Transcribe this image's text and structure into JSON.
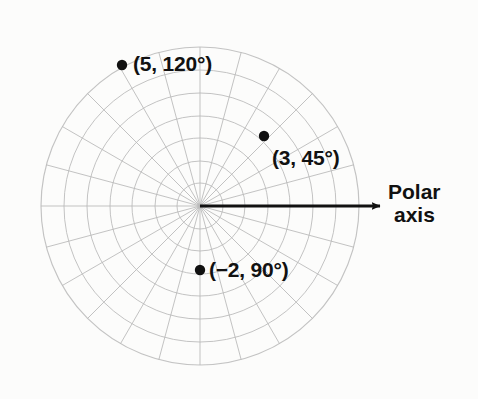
{
  "figure": {
    "background_color": "#fcfcfb",
    "grid_color": "#b9b9b9",
    "ink_color": "#111111"
  },
  "axis": {
    "name": "polar-axis",
    "label_line1": "Polar",
    "label_line2": "axis",
    "arrow_from": [
      200,
      206
    ],
    "arrow_to": [
      380,
      206
    ]
  },
  "chart_data": {
    "type": "scatter",
    "coordinate_system": "polar",
    "title": "",
    "xlabel": "",
    "ylabel": "",
    "center": [
      200,
      206
    ],
    "outer_radius": 159,
    "rings": 7,
    "ring_radii": [
      23,
      45,
      68,
      90,
      113,
      136,
      159
    ],
    "radial_lines": 24,
    "radial_step_degrees": 15,
    "grid": true,
    "legend": "none",
    "points": [
      {
        "label": "(5, 120°)",
        "r": 5,
        "theta_degrees": 120,
        "px": [
          122,
          65
        ],
        "label_px": [
          133,
          52
        ]
      },
      {
        "label": "(3, 45°)",
        "r": 3,
        "theta_degrees": 45,
        "px": [
          264,
          136
        ],
        "label_px": [
          272,
          146
        ]
      },
      {
        "label": "(−2, 90°)",
        "r": -2,
        "theta_degrees": 90,
        "px": [
          200,
          270
        ],
        "label_px": [
          209,
          258
        ]
      }
    ]
  }
}
